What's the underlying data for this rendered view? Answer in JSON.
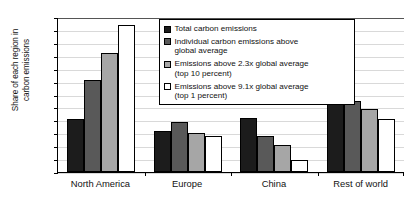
{
  "chart_data": {
    "type": "bar",
    "title": "",
    "xlabel": "",
    "ylabel": "Share of each region in\ncarbon emissions",
    "ylim": [
      0,
      60
    ],
    "ytick_labels": [
      "60%",
      "55%",
      "50%",
      "45%",
      "40%",
      "35%",
      "30%",
      "25%",
      "20%",
      "15%",
      "10%",
      "5%",
      "0%"
    ],
    "ytick_values": [
      60,
      55,
      50,
      45,
      40,
      35,
      30,
      25,
      20,
      15,
      10,
      5,
      0
    ],
    "grid": true,
    "legend_position": "top-right-inside",
    "categories": [
      "North America",
      "Europe",
      "China",
      "Rest of world"
    ],
    "series": [
      {
        "name": "Total carbon emissions",
        "color": "#1c1c1c",
        "values": [
          20.5,
          16.0,
          21.0,
          39.5
        ]
      },
      {
        "name": "Individual carbon emissions above global average",
        "color": "#595959",
        "values": [
          35.5,
          19.5,
          14.0,
          27.5
        ]
      },
      {
        "name": "Emissions above 2.3x global average (top 10 percent)",
        "color": "#a6a6a6",
        "values": [
          46.0,
          15.0,
          10.5,
          24.5
        ]
      },
      {
        "name": "Emissions above 9.1x global average (top 1 percent)",
        "color": "#ffffff",
        "values": [
          57.0,
          14.0,
          4.5,
          20.5
        ]
      }
    ]
  },
  "axis": {
    "y_title_line1": "Share of each region in",
    "y_title_line2": "carbon emissions"
  },
  "legend": {
    "items": [
      {
        "label": "Total carbon emissions",
        "swatch": "s0"
      },
      {
        "label": "Individual carbon emissions above\nglobal average",
        "swatch": "s1"
      },
      {
        "label": "Emissions above 2.3x global average\n(top 10 percent)",
        "swatch": "s2"
      },
      {
        "label": "Emissions above 9.1x global average\n(top 1 percent)",
        "swatch": "s3"
      }
    ]
  }
}
